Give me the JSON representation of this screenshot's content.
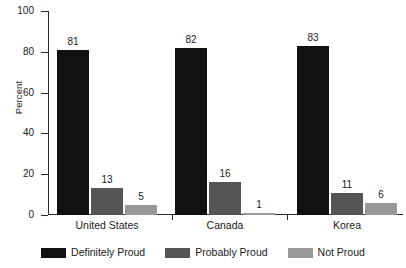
{
  "chart_data": {
    "type": "bar",
    "title": "",
    "xlabel": "",
    "ylabel": "Percent",
    "ylim": [
      0,
      100
    ],
    "yticks": [
      0,
      20,
      40,
      60,
      80,
      100
    ],
    "grid": false,
    "legend_position": "bottom",
    "categories": [
      "United States",
      "Canada",
      "Korea"
    ],
    "series": [
      {
        "name": "Definitely Proud",
        "color": "#111111",
        "values": [
          81,
          82,
          83
        ]
      },
      {
        "name": "Probably Proud",
        "color": "#555555",
        "values": [
          13,
          16,
          11
        ]
      },
      {
        "name": "Not Proud",
        "color": "#999999",
        "values": [
          5,
          1,
          6
        ]
      }
    ]
  },
  "axis": {
    "y_label": "Percent",
    "y_tick_labels": [
      "100",
      "80",
      "60",
      "40",
      "20",
      "0"
    ]
  },
  "groups": [
    {
      "label": "United States",
      "values": [
        "81",
        "13",
        "5"
      ]
    },
    {
      "label": "Canada",
      "values": [
        "82",
        "16",
        "1"
      ]
    },
    {
      "label": "Korea",
      "values": [
        "83",
        "11",
        "6"
      ]
    }
  ],
  "legend": {
    "items": [
      {
        "label": "Definitely Proud"
      },
      {
        "label": "Probably Proud"
      },
      {
        "label": "Not Proud"
      }
    ]
  }
}
